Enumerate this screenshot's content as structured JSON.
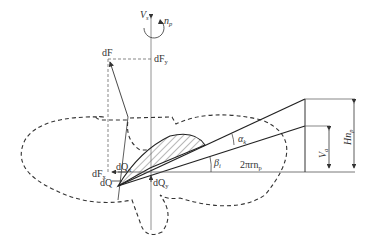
{
  "diagram": {
    "labels": {
      "axial_velocity": "V",
      "axial_velocity_sub": "s",
      "rotation": "n",
      "rotation_sub": "p",
      "total_force": "dF",
      "force_y": "dF",
      "force_y_sub": "y",
      "force_x": "dF",
      "force_x_sub": "x",
      "torque_x": "dQ",
      "torque_x_sub": "x",
      "torque": "dQ",
      "torque_y": "dQ",
      "torque_y_sub": "y",
      "attack_angle": "α",
      "attack_angle_sub": "k",
      "pitch_angle": "β",
      "pitch_angle_sub": "i",
      "circumferential": "2πrn",
      "circumferential_sub": "p",
      "advance": "V",
      "advance_sub": "a",
      "pitch": "Hn",
      "pitch_sub": "p"
    },
    "colors": {
      "line": "#333333",
      "dashed": "#333333",
      "background": "#ffffff"
    }
  }
}
